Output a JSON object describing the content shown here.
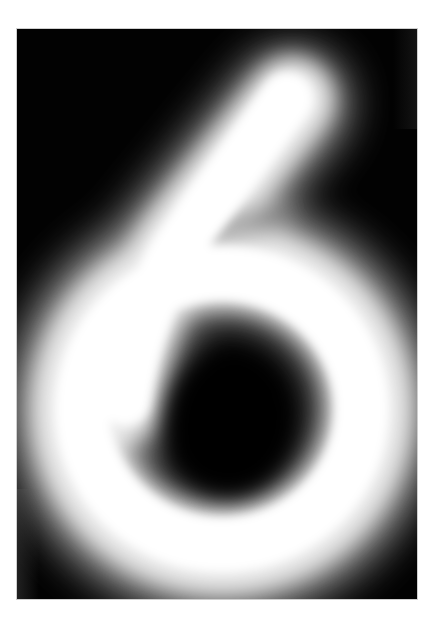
{
  "image": {
    "subject": "handwritten digit",
    "digit": "6",
    "caption": "",
    "style": "blurred pixelated grayscale digit on black background",
    "colors": {
      "background": "#ffffff",
      "frame": "#020202",
      "stroke": "#ffffff"
    }
  }
}
